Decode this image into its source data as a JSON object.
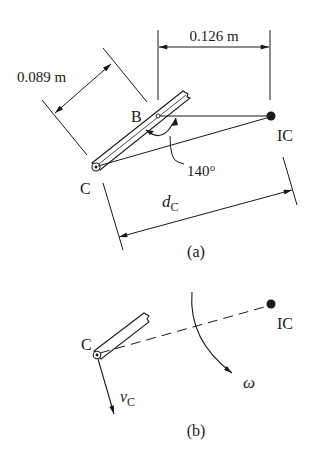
{
  "figure_a": {
    "caption": "(a)",
    "labels": {
      "point_b": "B",
      "point_c": "C",
      "point_ic": "IC",
      "angle": "140°",
      "dim_bc": "0.089 m",
      "dim_b_ic": "0.126 m",
      "dim_dc_main": "d",
      "dim_dc_sub": "C"
    }
  },
  "figure_b": {
    "caption": "(b)",
    "labels": {
      "point_c": "C",
      "point_ic": "IC",
      "omega": "ω",
      "vel_main": "v",
      "vel_sub": "C"
    }
  },
  "colors": {
    "ink": "#1a1a1a",
    "background": "#ffffff"
  }
}
